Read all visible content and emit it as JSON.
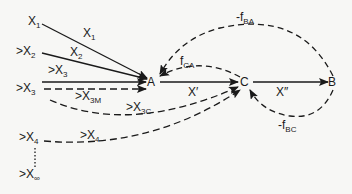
{
  "diagram": {
    "nodes": [
      {
        "id": "A",
        "label": "A"
      },
      {
        "id": "C",
        "label": "C"
      },
      {
        "id": "B",
        "label": "B"
      }
    ],
    "sources": [
      {
        "id": "x1",
        "prefix": "",
        "base": "X",
        "sub": "1"
      },
      {
        "id": "x2",
        "prefix": ">",
        "base": "X",
        "sub": "2"
      },
      {
        "id": "x3",
        "prefix": ">",
        "base": "X",
        "sub": "3"
      },
      {
        "id": "x4",
        "prefix": ">",
        "base": "X",
        "sub": "4"
      },
      {
        "id": "xinf",
        "prefix": ">",
        "base": "X",
        "sub": "∞"
      }
    ],
    "edge_labels": {
      "x1": {
        "prefix": "",
        "base": "X",
        "sub": "1"
      },
      "x2": {
        "prefix": "",
        "base": "X",
        "sub": "2"
      },
      "x3": {
        "prefix": ">",
        "base": "X",
        "sub": "3"
      },
      "x3m": {
        "prefix": ">",
        "base": "X",
        "sub": "3M"
      },
      "x3c": {
        "prefix": ">",
        "base": "X",
        "sub": "3C"
      },
      "x4": {
        "prefix": ">",
        "base": "X",
        "sub": "4"
      },
      "a_to_c": "X′",
      "c_to_b": "X″",
      "fca": {
        "prefix": "",
        "base": "f",
        "sub": "CA"
      },
      "fba": {
        "prefix": "-",
        "base": "f",
        "sub": "BA"
      },
      "fbc": {
        "prefix": "-",
        "base": "f",
        "sub": "BC"
      }
    },
    "edges": [
      {
        "from": "X1",
        "to": "A",
        "style": "solid",
        "label": "X1"
      },
      {
        "from": ">X2",
        "to": "A",
        "style": "solid",
        "label": "X2"
      },
      {
        "from": ">X3",
        "to": "A",
        "style": "solid",
        "label": ">X3"
      },
      {
        "from": ">X3",
        "to": "A",
        "style": "dashed",
        "label": ">X3M"
      },
      {
        "from": ">X3",
        "to": "C",
        "style": "dashed",
        "label": ">X3C"
      },
      {
        "from": ">X4",
        "to": "C",
        "style": "dashed",
        "label": ">X4"
      },
      {
        "from": ">X4",
        "to": ">X∞",
        "style": "dotted",
        "label": ""
      },
      {
        "from": "A",
        "to": "C",
        "style": "solid",
        "label": "X′"
      },
      {
        "from": "C",
        "to": "B",
        "style": "solid",
        "label": "X″"
      },
      {
        "from": "C",
        "to": "A",
        "style": "dashed",
        "label": "fCA"
      },
      {
        "from": "B",
        "to": "A",
        "style": "dashed",
        "label": "-fBA"
      },
      {
        "from": "B",
        "to": "C",
        "style": "dashed",
        "label": "-fBC"
      }
    ]
  },
  "colors": {
    "ink": "#1a1a1a",
    "background": "#f7f7f5"
  }
}
